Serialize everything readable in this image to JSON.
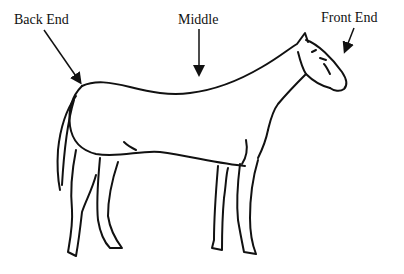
{
  "diagram": {
    "labels": {
      "back_end": "Back End",
      "middle": "Middle",
      "front_end": "Front End"
    },
    "colors": {
      "ink": "#111111",
      "background": "#ffffff"
    }
  }
}
